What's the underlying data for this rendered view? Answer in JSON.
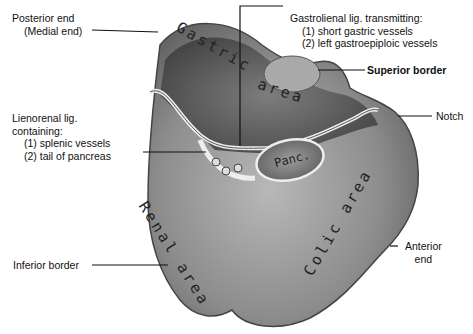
{
  "figure": {
    "surface_labels": {
      "gastric": "Gastric area",
      "gastric_word1": "Gastric",
      "gastric_word2": "area",
      "renal": "Renal area",
      "renal_word1": "Renal",
      "renal_word2": "area",
      "colic": "Colic area",
      "pancreas_abbrev": "Panc."
    },
    "callouts": {
      "posterior_end": {
        "line1": "Posterior end",
        "line2": "(Medial end)"
      },
      "gastrolienal": {
        "title": "Gastrolienal lig. transmitting:",
        "item1": "(1) short gastric vessels",
        "item2": "(2) left gastroepiploic vessels"
      },
      "superior_border": "Superior border",
      "notch": "Notch",
      "lienorenal": {
        "line1": "Lienorenal lig.",
        "line2": "containing:",
        "item1": "(1) splenic vessels",
        "item2": "(2) tail of pancreas"
      },
      "inferior_border": "Inferior border",
      "anterior_end": {
        "line1": "Anterior",
        "line2": "end"
      }
    },
    "colors": {
      "background": "#ffffff",
      "organ_dark": "#4a4a4a",
      "organ_mid": "#8a8a8a",
      "organ_light": "#c9c9c9",
      "leader_line": "#111111"
    }
  }
}
